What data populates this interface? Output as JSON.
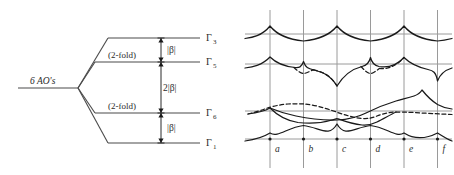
{
  "figure": {
    "left_panel": {
      "name": "energy-level-splitting-diagram",
      "source_label": "6 AO's",
      "degeneracy_labels": [
        "(2-fold)",
        "(2-fold)"
      ],
      "levels": [
        {
          "id": "gamma3",
          "symbol": "Γ",
          "subscript": "3",
          "y": 38
        },
        {
          "id": "gamma5",
          "symbol": "Γ",
          "subscript": "5",
          "y": 62,
          "degeneracy": "(2-fold)"
        },
        {
          "id": "gamma6",
          "symbol": "Γ",
          "subscript": "6",
          "y": 113,
          "degeneracy": "(2-fold)"
        },
        {
          "id": "gamma1",
          "symbol": "Γ",
          "subscript": "1",
          "y": 143
        }
      ],
      "gaps": [
        {
          "id": "gap-upper",
          "label": "|β|",
          "from": "gamma3",
          "to": "gamma5"
        },
        {
          "id": "gap-middle",
          "label": "2|β|",
          "from": "gamma5",
          "to": "gamma6"
        },
        {
          "id": "gap-lower",
          "label": "|β|",
          "from": "gamma6",
          "to": "gamma1"
        }
      ]
    },
    "right_panel": {
      "name": "band-structure-diagram",
      "x_tick_labels": [
        "a",
        "b",
        "c",
        "d",
        "e",
        "f"
      ],
      "x_tick_positions": [
        270,
        303.5,
        337,
        370.5,
        404,
        437.5
      ],
      "horizontal_levels": [
        34,
        64,
        111,
        139
      ],
      "axis_x_range": [
        243,
        452
      ],
      "axis_y_range": [
        10,
        168
      ],
      "bands": [
        {
          "id": "band-1-upper",
          "style": "solid",
          "description": "top band: cusped peaks at a, c, e; dips at b, d, f"
        },
        {
          "id": "band-2-solid",
          "style": "solid",
          "description": "second band: peaks at a, b, d, e; sharp dips at c and f"
        },
        {
          "id": "band-2-dashed",
          "style": "dashed",
          "description": "second band partner: small lens lobes below a-b and d-e"
        },
        {
          "id": "band-3-solid",
          "style": "solid",
          "description": "third band: rises from left, dips near c, rises steeply to peak near e-f"
        },
        {
          "id": "band-3-dashed",
          "style": "dashed",
          "description": "third band partner: gently descending dashed curve"
        },
        {
          "id": "band-4-solid",
          "style": "solid",
          "description": "lower band: arches between tick marks a-f"
        },
        {
          "id": "band-5-bottom",
          "style": "solid",
          "description": "bottom band: scalloped arcs resting on the lowest level"
        }
      ]
    },
    "colors": {
      "ink": "#1a1a1a",
      "grid": "#9a9a9a",
      "level": "#4a4a4a",
      "background": "#ffffff"
    }
  }
}
